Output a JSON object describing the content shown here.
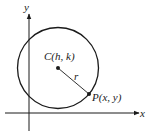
{
  "diagram": {
    "axes": {
      "x_label": "x",
      "y_label": "y"
    },
    "circle": {
      "center_label_prefix": "C",
      "center_label_args": "(h, k)",
      "radius_label": "r",
      "point_label_prefix": "P",
      "point_label_args": "(x, y)"
    },
    "colors": {
      "stroke": "#1a1a1a",
      "background": "#ffffff"
    }
  }
}
